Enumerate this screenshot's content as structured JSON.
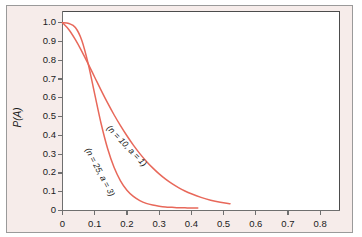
{
  "figure": {
    "background_color": "#f6ecea",
    "plot_background_color": "#ffffff",
    "frame_color": "#4c4c4c",
    "curve_color": "#e8685a"
  },
  "chart_data": {
    "type": "line",
    "title": "",
    "xlabel": "",
    "ylabel": "P(A)",
    "xlim": [
      0,
      0.86
    ],
    "ylim": [
      0,
      1.06
    ],
    "grid": false,
    "legend": "inline-annotations",
    "xticks": [
      "0",
      "0.1",
      "0.2",
      "0.3",
      "0.4",
      "0.5",
      "0.6",
      "0.7",
      "0.8"
    ],
    "xtick_values": [
      0,
      0.1,
      0.2,
      0.3,
      0.4,
      0.5,
      0.6,
      0.7,
      0.8
    ],
    "yticks": [
      "0",
      "0.1",
      "0.2",
      "0.3",
      "0.4",
      "0.5",
      "0.6",
      "0.7",
      "0.8",
      "0.9",
      "1.0"
    ],
    "ytick_values": [
      0,
      0.1,
      0.2,
      0.3,
      0.4,
      0.5,
      0.6,
      0.7,
      0.8,
      0.9,
      1.0
    ],
    "series": [
      {
        "name": "(n = 10, a = 1)",
        "label": "(n = 10, a = 1)",
        "color": "#e8685a",
        "x": [
          0.0,
          0.02,
          0.04,
          0.06,
          0.08,
          0.1,
          0.12,
          0.14,
          0.16,
          0.18,
          0.2,
          0.22,
          0.24,
          0.26,
          0.28,
          0.3,
          0.32,
          0.34,
          0.36,
          0.38,
          0.4,
          0.43,
          0.46,
          0.49,
          0.52
        ],
        "y": [
          1.0,
          0.963,
          0.91,
          0.848,
          0.78,
          0.71,
          0.64,
          0.573,
          0.51,
          0.452,
          0.398,
          0.348,
          0.303,
          0.263,
          0.227,
          0.195,
          0.167,
          0.143,
          0.122,
          0.104,
          0.089,
          0.07,
          0.055,
          0.044,
          0.036
        ]
      },
      {
        "name": "(n = 25, a = 3)",
        "label": "(n = 25, a = 3)",
        "color": "#e8685a",
        "x": [
          0.0,
          0.02,
          0.04,
          0.06,
          0.08,
          0.1,
          0.12,
          0.14,
          0.16,
          0.18,
          0.2,
          0.22,
          0.24,
          0.26,
          0.28,
          0.3,
          0.32,
          0.34,
          0.36,
          0.38,
          0.4,
          0.42
        ],
        "y": [
          1.0,
          0.996,
          0.975,
          0.906,
          0.78,
          0.62,
          0.462,
          0.33,
          0.23,
          0.158,
          0.108,
          0.075,
          0.053,
          0.038,
          0.029,
          0.023,
          0.019,
          0.017,
          0.015,
          0.014,
          0.013,
          0.013
        ]
      }
    ],
    "annotations": [
      {
        "text": "(n = 10, a = 1)",
        "x": 0.155,
        "y": 0.465,
        "rotation_deg": 46
      },
      {
        "text": "(n = 25, a = 3)",
        "x": 0.093,
        "y": 0.345,
        "rotation_deg": 62
      }
    ]
  }
}
